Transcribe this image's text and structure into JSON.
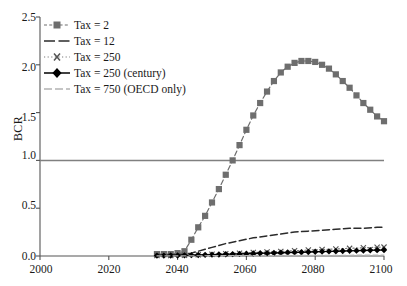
{
  "chart_data": {
    "type": "line",
    "title": "",
    "subtitle": "",
    "xlabel": "",
    "ylabel": "BCR",
    "xlim": [
      2000,
      2100
    ],
    "ylim": [
      0.0,
      2.5
    ],
    "xticks": [
      "2000",
      "2020",
      "2040",
      "2060",
      "2080",
      "2100"
    ],
    "xtick_values": [
      2000,
      2020,
      2040,
      2060,
      2080,
      2100
    ],
    "yticks": [
      "0.0",
      "0.5",
      "1.0",
      "1.5",
      "2.0",
      "2.5"
    ],
    "ytick_values": [
      0.0,
      0.5,
      1.0,
      1.5,
      2.0,
      2.5
    ],
    "grid": false,
    "legend_position": "top-left",
    "reference_line": {
      "label": "BCR = 1.0",
      "value": 1.0,
      "color": "#808080",
      "style": "solid"
    },
    "series": [
      {
        "name": "Tax = 2",
        "marker": "square",
        "linestyle": "dashed",
        "color": "#6e6e6e",
        "x": [
          2034,
          2036,
          2038,
          2040,
          2042,
          2044,
          2046,
          2048,
          2050,
          2052,
          2054,
          2056,
          2058,
          2060,
          2062,
          2064,
          2066,
          2068,
          2070,
          2072,
          2074,
          2076,
          2078,
          2080,
          2082,
          2084,
          2086,
          2088,
          2090,
          2092,
          2094,
          2096,
          2098,
          2100
        ],
        "values": [
          0.02,
          0.02,
          0.02,
          0.03,
          0.05,
          0.17,
          0.3,
          0.42,
          0.56,
          0.7,
          0.85,
          1.0,
          1.16,
          1.32,
          1.47,
          1.6,
          1.72,
          1.83,
          1.92,
          1.98,
          2.02,
          2.04,
          2.04,
          2.03,
          2.0,
          1.96,
          1.9,
          1.83,
          1.76,
          1.68,
          1.6,
          1.53,
          1.46,
          1.41
        ]
      },
      {
        "name": "Tax = 12",
        "marker": "none",
        "linestyle": "dashed",
        "color": "#2b2b2b",
        "x": [
          2034,
          2038,
          2042,
          2044,
          2046,
          2048,
          2050,
          2054,
          2058,
          2062,
          2066,
          2070,
          2074,
          2078,
          2082,
          2086,
          2090,
          2094,
          2098,
          2100
        ],
        "values": [
          0.01,
          0.01,
          0.02,
          0.03,
          0.05,
          0.07,
          0.09,
          0.13,
          0.16,
          0.19,
          0.21,
          0.23,
          0.25,
          0.26,
          0.27,
          0.28,
          0.29,
          0.29,
          0.3,
          0.3
        ]
      },
      {
        "name": "Tax = 250",
        "marker": "x",
        "linestyle": "dotted",
        "color": "#7a7a7a",
        "x": [
          2034,
          2038,
          2042,
          2046,
          2050,
          2054,
          2058,
          2062,
          2066,
          2070,
          2074,
          2078,
          2082,
          2086,
          2090,
          2094,
          2098,
          2100
        ],
        "values": [
          0.005,
          0.005,
          0.008,
          0.012,
          0.018,
          0.024,
          0.03,
          0.036,
          0.042,
          0.048,
          0.055,
          0.062,
          0.068,
          0.074,
          0.08,
          0.086,
          0.091,
          0.093
        ]
      },
      {
        "name": "Tax = 250 (century)",
        "marker": "diamond",
        "linestyle": "solid",
        "color": "#000000",
        "x": [
          2034,
          2036,
          2038,
          2040,
          2042,
          2044,
          2046,
          2048,
          2050,
          2052,
          2054,
          2056,
          2058,
          2060,
          2062,
          2064,
          2066,
          2068,
          2070,
          2072,
          2074,
          2076,
          2078,
          2080,
          2082,
          2084,
          2086,
          2088,
          2090,
          2092,
          2094,
          2096,
          2098,
          2100
        ],
        "values": [
          0.004,
          0.004,
          0.005,
          0.006,
          0.007,
          0.009,
          0.01,
          0.012,
          0.014,
          0.016,
          0.018,
          0.02,
          0.022,
          0.024,
          0.026,
          0.028,
          0.03,
          0.032,
          0.034,
          0.036,
          0.038,
          0.04,
          0.042,
          0.044,
          0.046,
          0.048,
          0.05,
          0.052,
          0.054,
          0.056,
          0.058,
          0.06,
          0.061,
          0.062
        ]
      },
      {
        "name": "Tax = 750 (OECD only)",
        "marker": "none",
        "linestyle": "dashed",
        "color": "#b3b3b3",
        "x": [
          2034,
          2042,
          2050,
          2058,
          2066,
          2074,
          2082,
          2090,
          2098,
          2100
        ],
        "values": [
          0.001,
          0.002,
          0.003,
          0.004,
          0.005,
          0.006,
          0.007,
          0.008,
          0.009,
          0.009
        ]
      }
    ]
  },
  "axes": {
    "ylabel": "BCR",
    "ytick_labels": [
      "2.5",
      "2.0",
      "1.5",
      "1.0",
      "0.5",
      "0.0"
    ],
    "xtick_labels": [
      "2000",
      "2020",
      "2040",
      "2060",
      "2080",
      "2100"
    ]
  },
  "legend": {
    "entries": [
      {
        "label": "Tax = 2",
        "key": "square-dashed-key"
      },
      {
        "label": "Tax = 12",
        "key": "dark-dashed-key"
      },
      {
        "label": "Tax = 250",
        "key": "cross-dotted-key"
      },
      {
        "label": "Tax = 250 (century)",
        "key": "diamond-solid-key"
      },
      {
        "label": "Tax = 750 (OECD only)",
        "key": "light-dashed-key"
      }
    ]
  },
  "colors": {
    "tax2": "#6e6e6e",
    "tax12": "#2b2b2b",
    "tax250": "#7a7a7a",
    "tax250_century": "#000000",
    "tax750": "#b3b3b3",
    "axis": "#555555",
    "reference": "#808080"
  }
}
